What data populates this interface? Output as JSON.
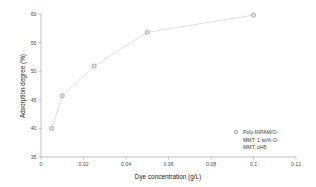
{
  "chart_data": {
    "type": "scatter",
    "title": "",
    "xlabel": "Dye concentration (g/L)",
    "ylabel": "Adsorption degree (%)",
    "xlim": [
      0,
      0.12
    ],
    "ylim": [
      35,
      60
    ],
    "xticks": [
      "0",
      "0.02",
      "0.04",
      "0.06",
      "0.08",
      "0.1",
      "0.12"
    ],
    "xtick_values": [
      0,
      0.02,
      0.04,
      0.06,
      0.08,
      0.1,
      0.12
    ],
    "yticks": [
      "35",
      "40",
      "45",
      "50",
      "55",
      "60"
    ],
    "ytick_values": [
      35,
      40,
      45,
      50,
      55,
      60
    ],
    "grid": false,
    "legend_position": "lower-right",
    "series": [
      {
        "name": "Poly-NIPAM/O-MMT: 1 wt% O-MMT; pH5",
        "marker": "circle",
        "marker_color": "#e2e2e2",
        "line_color": "#cfcfcf",
        "x": [
          0.005,
          0.01,
          0.025,
          0.05,
          0.1
        ],
        "y": [
          40.0,
          45.7,
          50.9,
          56.8,
          59.8
        ]
      }
    ]
  },
  "legend": {
    "lines": [
      "Poly-NIPAM/O-",
      "MMT: 1 wt% O-",
      "MMT; pH5"
    ]
  },
  "axes": {
    "x_title": "Dye concentration (g/L)",
    "y_title": "Adsorption degree (%)",
    "x_tick_labels": [
      "0",
      "0.02",
      "0.04",
      "0.06",
      "0.08",
      "0.1",
      "0.12"
    ],
    "y_tick_labels": [
      "35",
      "40",
      "45",
      "50",
      "55",
      "60"
    ]
  }
}
